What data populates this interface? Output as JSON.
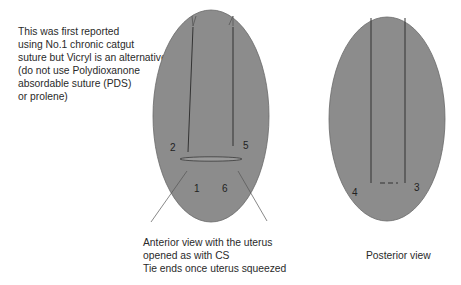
{
  "note": {
    "lines": [
      "This was first reported",
      "using No.1 chronic catgut",
      "suture but Vicryl is an alternative",
      "(do not use Polydioxanone",
      "absordable suture (PDS)",
      "or prolene)"
    ]
  },
  "anterior": {
    "caption_lines": [
      "Anterior view with the uterus",
      "opened as with CS",
      "Tie ends once uterus squeezed"
    ],
    "labels": {
      "p1": "1",
      "p2": "2",
      "p5": "5",
      "p6": "6"
    }
  },
  "posterior": {
    "caption": "Posterior view",
    "labels": {
      "p3": "3",
      "p4": "4"
    }
  },
  "colors": {
    "uterus_fill": "#8a8a8a",
    "suture_line": "#333333",
    "background": "#ffffff"
  }
}
